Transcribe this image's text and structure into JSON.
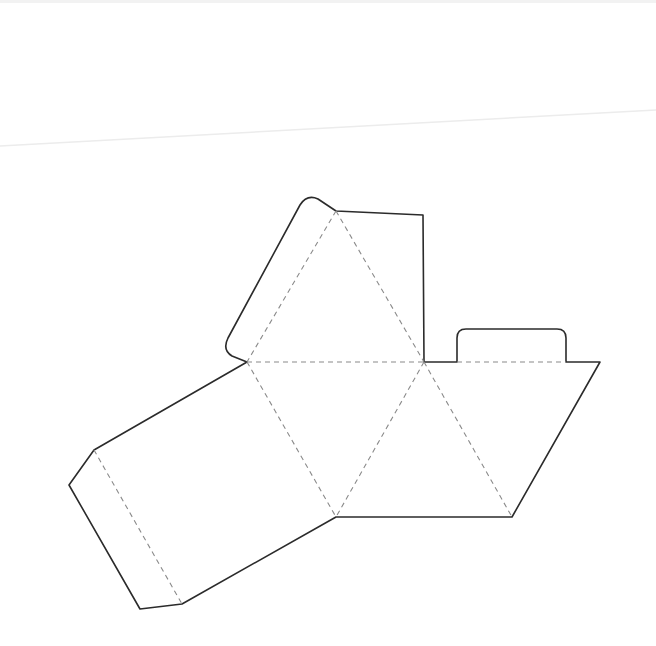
{
  "diagram": {
    "title": "",
    "type": "pyramid-box-net",
    "colors": {
      "background": "#ffffff",
      "cut_line": "#2b2b2b",
      "fold_line": "#8a8a8a",
      "paper_crease": "#ececec"
    },
    "legend": {
      "cut_line_style": "solid",
      "fold_line_style": "dashed"
    },
    "parts": [
      {
        "name": "top-triangle",
        "kind": "face"
      },
      {
        "name": "center-inverted-triangle",
        "kind": "face"
      },
      {
        "name": "right-triangle",
        "kind": "face"
      },
      {
        "name": "left-triangle",
        "kind": "face"
      },
      {
        "name": "left-rectangle-panel",
        "kind": "panel"
      },
      {
        "name": "left-end-flap",
        "kind": "glue-flap"
      },
      {
        "name": "top-left-rounded-flap",
        "kind": "tuck-flap"
      },
      {
        "name": "top-right-flap",
        "kind": "glue-flap"
      },
      {
        "name": "right-rounded-tab",
        "kind": "tuck-tab"
      }
    ]
  }
}
